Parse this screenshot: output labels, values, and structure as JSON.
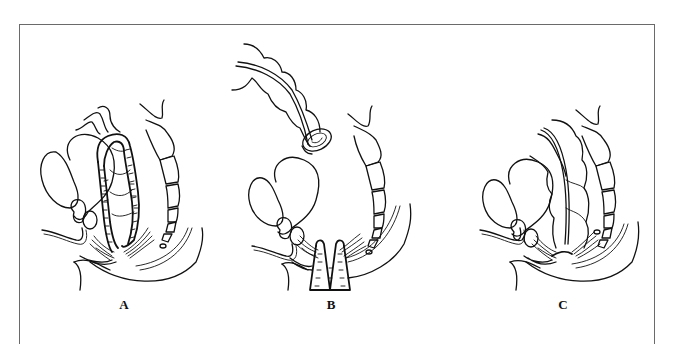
{
  "figure": {
    "panels": [
      {
        "id": "A",
        "label": "A",
        "label_x": 124,
        "label_y": 297
      },
      {
        "id": "B",
        "label": "B",
        "label_x": 331,
        "label_y": 297
      },
      {
        "id": "C",
        "label": "C",
        "label_x": 563,
        "label_y": 297
      }
    ],
    "colors": {
      "line": "#111111",
      "frame": "#6a6a6a",
      "background": "#ffffff"
    }
  }
}
